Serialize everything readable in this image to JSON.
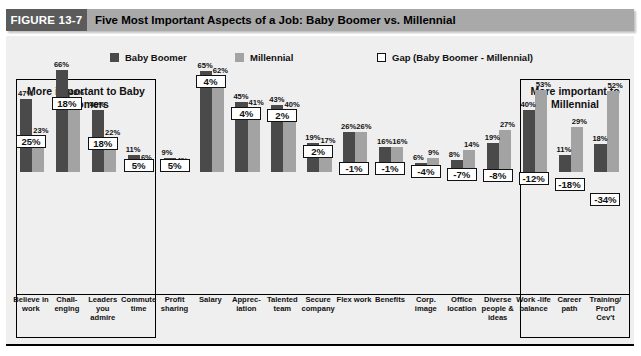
{
  "figure": {
    "tab_label": "FIGURE 13-7",
    "title": "Five Most Important Aspects of a Job: Baby Boomer vs. Millennial"
  },
  "legend": {
    "baby_boomer": "Baby Boomer",
    "millennial": "Millennial",
    "gap": "Gap (Baby Boomer - Millennial)"
  },
  "callouts": {
    "left": "More important to Baby Boomers",
    "right": "More important to Millennial"
  },
  "colors": {
    "baby_boomer": "#4a4a4a",
    "millennial": "#a3a3a3",
    "gap_box_fill": "#ffffff",
    "header_tab": "#5b5b5b",
    "header_bar": "#a9a9a9",
    "plot_background": "#efefef"
  },
  "chart_data": {
    "type": "bar",
    "title": "Five Most Important Aspects of a Job: Baby Boomer vs. Millennial",
    "xlabel": "",
    "ylabel": "",
    "ylim": [
      0,
      70
    ],
    "grid": false,
    "legend_position": "top",
    "categories": [
      "Believe in work",
      "Chall-enging",
      "Leaders you admire",
      "Commute time",
      "Profit sharing",
      "Salary",
      "Apprec-iation",
      "Talented team",
      "Secure company",
      "Flex work",
      "Benefits",
      "Corp. image",
      "Office location",
      "Diverse people & ideas",
      "Work -life balance",
      "Career path",
      "Training/ Prof'l Cev't"
    ],
    "series": [
      {
        "name": "Baby Boomer",
        "values": [
          47,
          66,
          40,
          11,
          9,
          65,
          45,
          43,
          19,
          26,
          16,
          6,
          8,
          19,
          40,
          11,
          18
        ]
      },
      {
        "name": "Millennial",
        "values": [
          23,
          48,
          22,
          6,
          4,
          62,
          41,
          40,
          17,
          26,
          16,
          9,
          14,
          27,
          53,
          29,
          52
        ]
      },
      {
        "name": "Gap (Baby Boomer - Millennial)",
        "values": [
          25,
          18,
          18,
          5,
          5,
          4,
          4,
          2,
          2,
          -1,
          -1,
          -4,
          -7,
          -8,
          -12,
          -18,
          -34
        ]
      }
    ],
    "value_labels": {
      "baby_boomer": [
        "47%",
        "66%",
        "40%",
        "11%",
        "9%",
        "65%",
        "45%",
        "43%",
        "19%",
        "26%",
        "16%",
        "6%",
        "8%",
        "19%",
        "40%",
        "11%",
        "18%"
      ],
      "millennial": [
        "23%",
        "48%",
        "22%",
        "6%",
        "4%",
        "62%",
        "41%",
        "40%",
        "17%",
        "26%",
        "16%",
        "9%",
        "14%",
        "27%",
        "53%",
        "29%",
        "52%"
      ],
      "gap": [
        "25%",
        "18%",
        "18%",
        "5%",
        "5%",
        "4%",
        "4%",
        "2%",
        "2%",
        "-1%",
        "-1%",
        "-4%",
        "-7%",
        "-8%",
        "-12%",
        "-18%",
        "-34%"
      ]
    }
  }
}
